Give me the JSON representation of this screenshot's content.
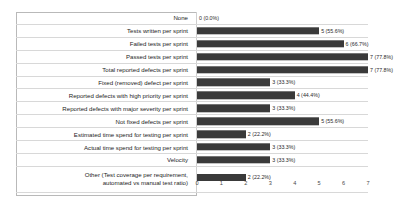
{
  "chart_data": {
    "type": "bar",
    "orientation": "horizontal",
    "title": "",
    "xlabel": "",
    "ylabel": "",
    "xlim": [
      0,
      7
    ],
    "xticks": [
      "0",
      "1",
      "2",
      "3",
      "4",
      "5",
      "6",
      "7"
    ],
    "grid": false,
    "legend": "none",
    "bar_color": "#3a3a3a",
    "categories": [
      "None",
      "Tests written per sprint",
      "Failed tests per sprint",
      "Passed tests per sprint",
      "Total reported defects per sprint",
      "Fixed (removed) defect per sprint",
      "Reported defects with high priority per sprint",
      "Reported defects with major severity per sprint",
      "Not fixed defects per sprint",
      "Estimated time spend for testing per sprint",
      "Actual time spend for testing per sprint",
      "Velocity",
      "Other (Test coverage per requirement,\nautomated vs manual test ratio)"
    ],
    "values": [
      0,
      5,
      6,
      7,
      7,
      3,
      4,
      3,
      5,
      2,
      3,
      3,
      2
    ],
    "percentages": [
      "0.0%",
      "55.6%",
      "66.7%",
      "77.8%",
      "77.8%",
      "33.3%",
      "44.4%",
      "33.3%",
      "55.6%",
      "22.2%",
      "33.3%",
      "33.3%",
      "22.2%"
    ],
    "data_labels": [
      "0 (0.0%)",
      "5 (55.6%)",
      "6 (66.7%)",
      "7 (77.8%)",
      "7 (77.8%)",
      "3 (33.3%)",
      "4 (44.4%)",
      "3 (33.3%)",
      "5 (55.6%)",
      "2 (22.2%)",
      "3 (33.3%)",
      "3 (33.3%)",
      "2 (22.2%)"
    ]
  }
}
